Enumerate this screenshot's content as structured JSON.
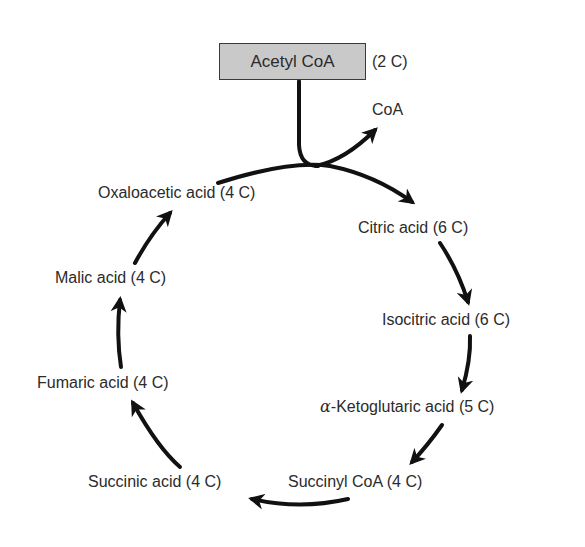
{
  "input": {
    "name": "Acetyl CoA",
    "carbons": "(2 C)",
    "box_fill": "#c9c9c9"
  },
  "released": {
    "name": "CoA"
  },
  "cycle": {
    "direction": "clockwise",
    "arrow_color": "#111111",
    "intermediates": [
      {
        "name": "Citric acid (6 C)"
      },
      {
        "name": "Isocitric acid (6 C)"
      },
      {
        "prefix": "α",
        "name": "-Ketoglutaric acid (5 C)"
      },
      {
        "name": "Succinyl CoA (4 C)"
      },
      {
        "name": "Succinic acid (4 C)"
      },
      {
        "name": "Fumaric acid (4 C)"
      },
      {
        "name": "Malic acid (4 C)"
      },
      {
        "name": "Oxaloacetic acid (4 C)"
      }
    ]
  }
}
